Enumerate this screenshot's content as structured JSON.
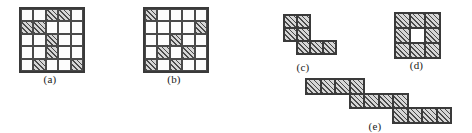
{
  "figure": {
    "background_color": "#ffffff",
    "line_color": "#3a3a3a",
    "hatch_color": "#4a4a4a",
    "fill_color": "#d6d6d6",
    "panels": [
      {
        "id": "a",
        "label": "(a)",
        "type": "grid",
        "rows": 5,
        "cols": 5,
        "filled_cells": [
          [
            0,
            2
          ],
          [
            0,
            3
          ],
          [
            1,
            0
          ],
          [
            1,
            1
          ],
          [
            2,
            2
          ],
          [
            3,
            2
          ],
          [
            4,
            1
          ],
          [
            4,
            4
          ]
        ]
      },
      {
        "id": "b",
        "label": "(b)",
        "type": "grid",
        "rows": 5,
        "cols": 5,
        "filled_cells": [
          [
            0,
            0
          ],
          [
            1,
            4
          ],
          [
            2,
            2
          ],
          [
            3,
            1
          ],
          [
            3,
            3
          ],
          [
            4,
            0
          ],
          [
            4,
            2
          ]
        ]
      },
      {
        "id": "c",
        "label": "(c)",
        "type": "polyomino",
        "cells": [
          [
            0,
            0
          ],
          [
            0,
            1
          ],
          [
            1,
            0
          ],
          [
            1,
            1
          ],
          [
            2,
            1
          ],
          [
            2,
            2
          ],
          [
            2,
            3
          ]
        ],
        "holes": []
      },
      {
        "id": "d",
        "label": "(d)",
        "type": "polyomino",
        "cells": [
          [
            0,
            0
          ],
          [
            0,
            1
          ],
          [
            0,
            2
          ],
          [
            1,
            0
          ],
          [
            1,
            2
          ],
          [
            2,
            0
          ],
          [
            2,
            1
          ],
          [
            2,
            2
          ]
        ],
        "holes": [
          [
            1,
            1
          ]
        ]
      },
      {
        "id": "e",
        "label": "(e)",
        "type": "polyomino",
        "cells": [
          [
            0,
            0
          ],
          [
            0,
            1
          ],
          [
            0,
            2
          ],
          [
            0,
            3
          ],
          [
            1,
            3
          ],
          [
            1,
            4
          ],
          [
            1,
            5
          ],
          [
            1,
            6
          ],
          [
            2,
            6
          ],
          [
            2,
            7
          ],
          [
            2,
            8
          ],
          [
            2,
            9
          ]
        ],
        "holes": []
      }
    ]
  }
}
